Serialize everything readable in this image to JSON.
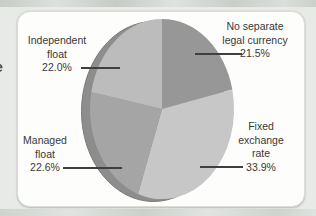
{
  "figure": {
    "margin_fragment": "e",
    "background_color": "#e7eae6",
    "card_color": "#fdfdfc"
  },
  "callouts": {
    "independent_float": {
      "line1": "Independent",
      "line2": "float",
      "pct": "22.0%"
    },
    "no_separate": {
      "line1": "No separate",
      "line2": "legal currency",
      "pct": "21.5%"
    },
    "managed_float": {
      "line1": "Managed",
      "line2": "float",
      "pct": "22.6%"
    },
    "fixed_rate": {
      "line1": "Fixed",
      "line2": "exchange",
      "line3": "rate",
      "pct": "33.9%"
    }
  },
  "chart_data": {
    "type": "pie",
    "style": "3d-ellipse",
    "title": "",
    "start_angle_deg": -90,
    "direction": "clockwise",
    "legend_position": "callouts",
    "segments": [
      {
        "label": "No separate legal currency",
        "value": 21.5,
        "color": "#979797"
      },
      {
        "label": "Fixed exchange rate",
        "value": 33.9,
        "color": "#c7c7c7"
      },
      {
        "label": "Managed float",
        "value": 22.6,
        "color": "#a5a5a5"
      },
      {
        "label": "Independent float",
        "value": 22.0,
        "color": "#bcbcbc"
      }
    ],
    "rim_color": "#8d8d8d",
    "rim_edge_color": "#7b7b7b"
  }
}
